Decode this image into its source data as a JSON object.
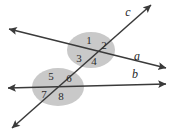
{
  "figure": {
    "kind": "geometry-diagram",
    "width": 172,
    "height": 134,
    "background_color": "#ffffff",
    "line_color": "#3a3a3a",
    "ellipse_fill": "#c9c9c9",
    "label_color": "#2b2b2b"
  },
  "lines": [
    {
      "name": "line-a",
      "label": "a",
      "label_x": 137,
      "label_y": 57,
      "x1": 9,
      "y1": 29,
      "x2": 166,
      "y2": 68,
      "arrow_start": true,
      "arrow_end": true
    },
    {
      "name": "line-b",
      "label": "b",
      "label_x": 135,
      "label_y": 75,
      "x1": 8,
      "y1": 88,
      "x2": 166,
      "y2": 84,
      "arrow_start": true,
      "arrow_end": true
    },
    {
      "name": "line-c",
      "label": "c",
      "label_x": 128,
      "label_y": 13,
      "x1": 12,
      "y1": 128,
      "x2": 151,
      "y2": 5,
      "arrow_start": true,
      "arrow_end": true
    }
  ],
  "intersections": [
    {
      "name": "intersection-a-c",
      "x": 91,
      "y": 52,
      "ellipse_cx": 91,
      "ellipse_cy": 50,
      "ellipse_rx": 24,
      "ellipse_ry": 18
    },
    {
      "name": "intersection-b-c",
      "x": 58,
      "y": 88,
      "ellipse_cx": 58,
      "ellipse_cy": 87,
      "ellipse_rx": 26,
      "ellipse_ry": 19
    }
  ],
  "angle_labels": [
    {
      "id": "1",
      "x": 89,
      "y": 41
    },
    {
      "id": "2",
      "x": 104,
      "y": 46
    },
    {
      "id": "3",
      "x": 79,
      "y": 59
    },
    {
      "id": "4",
      "x": 94,
      "y": 62
    },
    {
      "id": "5",
      "x": 51,
      "y": 77
    },
    {
      "id": "6",
      "x": 69,
      "y": 79
    },
    {
      "id": "7",
      "x": 44,
      "y": 95
    },
    {
      "id": "8",
      "x": 61,
      "y": 97
    }
  ]
}
